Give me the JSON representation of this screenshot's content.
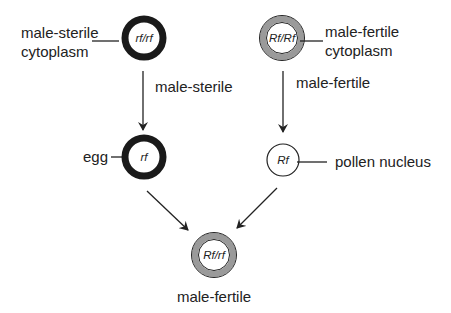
{
  "diagram": {
    "type": "cytoplasmic male sterility inheritance",
    "colors": {
      "sterile_ring": "#1a1a1a",
      "fertile_ring": "#9a9a9a",
      "outline": "#222222",
      "text": "#222222",
      "background": "#ffffff"
    },
    "nodes": {
      "sterile_parent": {
        "genotype": "rf/rf",
        "label_line1": "male-sterile",
        "label_line2": "cytoplasm",
        "cytoplasm": "male-sterile"
      },
      "fertile_parent": {
        "genotype": "Rf/Rf",
        "label_line1": "male-fertile",
        "label_line2": "cytoplasm",
        "cytoplasm": "male-fertile"
      },
      "egg": {
        "genotype": "rf",
        "label": "egg"
      },
      "pollen": {
        "genotype": "Rf",
        "label": "pollen nucleus"
      },
      "offspring": {
        "genotype": "Rf/rf",
        "label": "male-fertile"
      }
    },
    "edges": [
      {
        "from": "sterile_parent",
        "to": "egg",
        "label": "male-sterile"
      },
      {
        "from": "fertile_parent",
        "to": "pollen",
        "label": "male-fertile"
      },
      {
        "from": "egg",
        "to": "offspring",
        "label": ""
      },
      {
        "from": "pollen",
        "to": "offspring",
        "label": ""
      }
    ]
  }
}
